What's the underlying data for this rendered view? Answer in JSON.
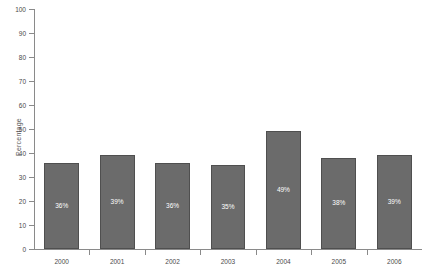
{
  "chart_data": {
    "type": "bar",
    "title": "",
    "xlabel": "",
    "ylabel": "Percentage",
    "categories": [
      "2000",
      "2001",
      "2002",
      "2003",
      "2004",
      "2005",
      "2006"
    ],
    "values": [
      36,
      39,
      36,
      35,
      49,
      38,
      39
    ],
    "data_labels": [
      "36%",
      "39%",
      "36%",
      "35%",
      "49%",
      "38%",
      "39%"
    ],
    "ylim": [
      0,
      100
    ],
    "ytick_values": [
      0,
      10,
      20,
      30,
      40,
      50,
      60,
      70,
      80,
      90,
      100
    ],
    "ytick_labels": [
      "0",
      "10",
      "20",
      "30",
      "40",
      "50",
      "60",
      "70",
      "80",
      "90",
      "100"
    ],
    "grid": false,
    "legend": false,
    "legend_position": "none",
    "colors": {
      "bar_fill": "#6b6b6b",
      "bar_outline": "#4f4f4f",
      "axis": "#8a8a8a",
      "tick_label": "#4a4a4a",
      "axis_title": "#555555",
      "data_label": "#ffffff",
      "background": "#ffffff"
    }
  }
}
